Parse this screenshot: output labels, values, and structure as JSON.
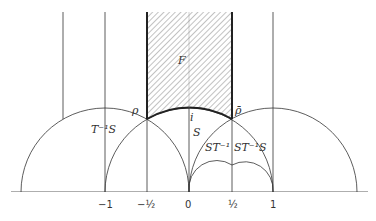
{
  "diagram": {
    "region_labels": {
      "F": "F",
      "S": "S",
      "T_inv_S": "T⁻¹S",
      "ST_inv": "ST⁻¹",
      "ST_inv_S": "ST⁻¹S"
    },
    "point_labels": {
      "rho": "ρ",
      "rho_bar": "ρ̄",
      "i": "i"
    },
    "axis_ticks": [
      {
        "value": -1,
        "label": "−1"
      },
      {
        "value": -0.5,
        "label": "−½"
      },
      {
        "value": 0,
        "label": "0"
      },
      {
        "value": 0.5,
        "label": "½"
      },
      {
        "value": 1,
        "label": "1"
      }
    ],
    "colors": {
      "stroke": "#333333",
      "hatch": "#555555",
      "background": "#ffffff"
    }
  }
}
